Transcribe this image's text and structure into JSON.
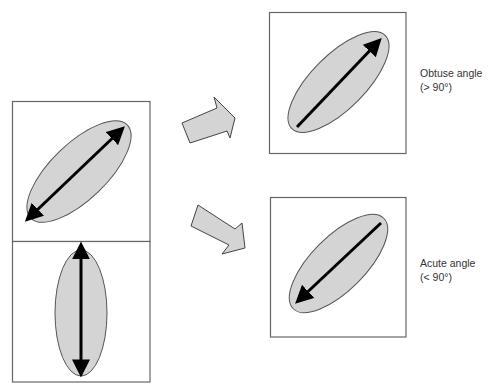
{
  "colors": {
    "ellipse_fill": "#d4d4d4",
    "stroke": "#555555",
    "arrow_black": "#000000",
    "box_border": "#666666",
    "text": "#333333"
  },
  "panels": {
    "source_top": {
      "description": "Tilted ellipse with double-headed arrow"
    },
    "source_bottom": {
      "description": "Vertical ellipse with double-headed arrow"
    },
    "result_top": {
      "description": "Tilted ellipse with arrow pointing up-right"
    },
    "result_bottom": {
      "description": "Tilted ellipse with arrow pointing down-left"
    }
  },
  "labels": {
    "obtuse": {
      "title": "Obtuse angle",
      "detail": "(> 90°)"
    },
    "acute": {
      "title": "Acute angle",
      "detail": "(< 90°)"
    }
  }
}
